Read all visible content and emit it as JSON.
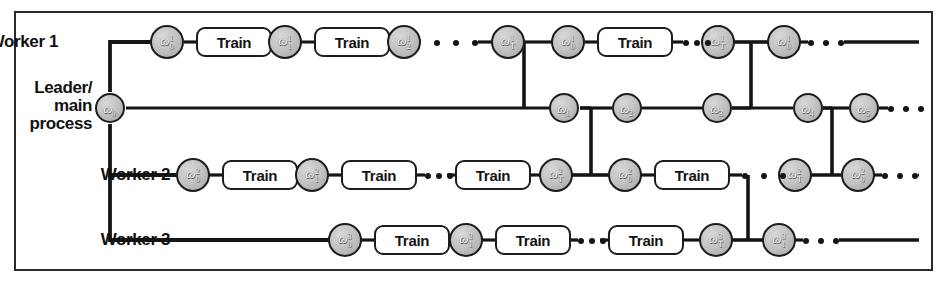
{
  "figure": {
    "border_color": "#2a2a2a",
    "node_fill": "#c4c4c4",
    "node_stroke": "#1d1d1d",
    "line_color": "#151515"
  },
  "rows": [
    {
      "id": "worker1",
      "label": "Worker 1",
      "label_lines": [
        "Worker 1"
      ]
    },
    {
      "id": "leader",
      "label": "Leader/ main process",
      "label_lines": [
        "Leader/",
        "main",
        "process"
      ]
    },
    {
      "id": "worker2",
      "label": "Worker 2",
      "label_lines": [
        "Worker 2"
      ]
    },
    {
      "id": "worker3",
      "label": "Worker 3",
      "label_lines": [
        "Worker 3"
      ]
    }
  ],
  "nodes": [
    {
      "id": "w1-n0",
      "row": "worker1",
      "x": 167,
      "y": 42,
      "base": "ω",
      "sup": "1",
      "sub": "0"
    },
    {
      "id": "w1-n1",
      "row": "worker1",
      "x": 285,
      "y": 42,
      "base": "ω",
      "sup": "1",
      "sub": "1"
    },
    {
      "id": "w1-n2",
      "row": "worker1",
      "x": 404,
      "y": 42,
      "base": "ω",
      "sup": "1",
      "sub": "2"
    },
    {
      "id": "w1-nT",
      "row": "worker1",
      "x": 508,
      "y": 42,
      "base": "ω",
      "sup": "1",
      "sub": "T"
    },
    {
      "id": "w1-m0",
      "row": "worker1",
      "x": 568,
      "y": 42,
      "base": "ω",
      "sup": "1",
      "sub": "0"
    },
    {
      "id": "w1-mT",
      "row": "worker1",
      "x": 718,
      "y": 42,
      "base": "ω",
      "sup": "1",
      "sub": "T"
    },
    {
      "id": "w1-k0",
      "row": "worker1",
      "x": 784,
      "y": 42,
      "base": "ω",
      "sup": "1",
      "sub": "0"
    },
    {
      "id": "ld-n0",
      "row": "leader",
      "x": 110,
      "y": 108,
      "base": "ω",
      "sup": "",
      "sub": "0"
    },
    {
      "id": "ld-n1",
      "row": "leader",
      "x": 564,
      "y": 108,
      "base": "ω",
      "sup": "",
      "sub": "1"
    },
    {
      "id": "ld-n2",
      "row": "leader",
      "x": 627,
      "y": 108,
      "base": "ω",
      "sup": "",
      "sub": "2"
    },
    {
      "id": "ld-n3",
      "row": "leader",
      "x": 717,
      "y": 108,
      "base": "ω",
      "sup": "",
      "sub": "3"
    },
    {
      "id": "ld-n4",
      "row": "leader",
      "x": 808,
      "y": 108,
      "base": "ω",
      "sup": "",
      "sub": "4"
    },
    {
      "id": "ld-n5",
      "row": "leader",
      "x": 864,
      "y": 108,
      "base": "ω",
      "sup": "",
      "sub": "5"
    },
    {
      "id": "w2-n0",
      "row": "worker2",
      "x": 193,
      "y": 175,
      "base": "ω",
      "sup": "2",
      "sub": "0"
    },
    {
      "id": "w2-n1",
      "row": "worker2",
      "x": 312,
      "y": 175,
      "base": "ω",
      "sup": "2",
      "sub": "1"
    },
    {
      "id": "w2-nT",
      "row": "worker2",
      "x": 556,
      "y": 175,
      "base": "ω",
      "sup": "2",
      "sub": "T"
    },
    {
      "id": "w2-m0",
      "row": "worker2",
      "x": 625,
      "y": 175,
      "base": "ω",
      "sup": "2",
      "sub": "0"
    },
    {
      "id": "w2-mT",
      "row": "worker2",
      "x": 795,
      "y": 175,
      "base": "ω",
      "sup": "2",
      "sub": "T"
    },
    {
      "id": "w2-k0",
      "row": "worker2",
      "x": 858,
      "y": 175,
      "base": "ω",
      "sup": "2",
      "sub": "0"
    },
    {
      "id": "w3-n0",
      "row": "worker3",
      "x": 345,
      "y": 240,
      "base": "ω",
      "sup": "3",
      "sub": "0"
    },
    {
      "id": "w3-n1",
      "row": "worker3",
      "x": 466,
      "y": 240,
      "base": "ω",
      "sup": "3",
      "sub": "1"
    },
    {
      "id": "w3-nT",
      "row": "worker3",
      "x": 716,
      "y": 240,
      "base": "ω",
      "sup": "3",
      "sub": "T"
    },
    {
      "id": "w3-m0",
      "row": "worker3",
      "x": 779,
      "y": 240,
      "base": "ω",
      "sup": "3",
      "sub": "1"
    }
  ],
  "train_boxes": [
    {
      "id": "w1-t1",
      "row": "worker1",
      "label": "Train",
      "x": 196,
      "y": 42,
      "w": 76
    },
    {
      "id": "w1-t2",
      "row": "worker1",
      "label": "Train",
      "x": 314,
      "y": 42,
      "w": 76
    },
    {
      "id": "w1-t3",
      "row": "worker1",
      "label": "Train",
      "x": 597,
      "y": 42,
      "w": 76
    },
    {
      "id": "w2-t1",
      "row": "worker2",
      "label": "Train",
      "x": 222,
      "y": 175,
      "w": 76
    },
    {
      "id": "w2-t2",
      "row": "worker2",
      "label": "Train",
      "x": 341,
      "y": 175,
      "w": 76
    },
    {
      "id": "w2-t3",
      "row": "worker2",
      "label": "Train",
      "x": 455,
      "y": 175,
      "w": 76
    },
    {
      "id": "w2-t4",
      "row": "worker2",
      "label": "Train",
      "x": 654,
      "y": 175,
      "w": 76
    },
    {
      "id": "w3-t1",
      "row": "worker3",
      "label": "Train",
      "x": 374,
      "y": 240,
      "w": 76
    },
    {
      "id": "w3-t2",
      "row": "worker3",
      "label": "Train",
      "x": 495,
      "y": 240,
      "w": 76
    },
    {
      "id": "w3-t3",
      "row": "worker3",
      "label": "Train",
      "x": 608,
      "y": 240,
      "w": 76
    }
  ],
  "ellipses": [
    {
      "id": "w1-d1",
      "row": "worker1",
      "x": 434,
      "y": 42,
      "w": 44
    },
    {
      "id": "w1-d2",
      "row": "worker1",
      "x": 683,
      "y": 42,
      "w": 28
    },
    {
      "id": "w1-d3",
      "row": "worker1",
      "x": 808,
      "y": 42,
      "w": 36
    },
    {
      "id": "ld-d1",
      "row": "leader",
      "x": 888,
      "y": 108,
      "w": 36
    },
    {
      "id": "w2-d1",
      "row": "worker2",
      "x": 425,
      "y": 175,
      "w": 28
    },
    {
      "id": "w2-d2",
      "row": "worker2",
      "x": 742,
      "y": 175,
      "w": 44
    },
    {
      "id": "w2-d3",
      "row": "worker2",
      "x": 882,
      "y": 175,
      "w": 36
    },
    {
      "id": "w3-d1",
      "row": "worker3",
      "x": 578,
      "y": 240,
      "w": 28
    },
    {
      "id": "w3-d2",
      "row": "worker3",
      "x": 803,
      "y": 240,
      "w": 36
    }
  ],
  "labels": {
    "worker1": {
      "text": "Worker 1",
      "x": 60,
      "y": 34
    },
    "leader": {
      "lines": [
        "Leader/",
        "main",
        "process"
      ],
      "x": 22,
      "y": 78
    },
    "worker2": {
      "text": "Worker 2",
      "x": 60,
      "y": 167
    },
    "worker3": {
      "text": "Worker 3",
      "x": 60,
      "y": 232
    }
  }
}
